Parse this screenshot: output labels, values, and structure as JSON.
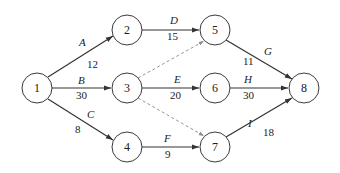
{
  "diagram": {
    "type": "activity-on-arrow network",
    "nodes": [
      {
        "id": "1",
        "label": "1",
        "x": 37,
        "y": 88
      },
      {
        "id": "2",
        "label": "2",
        "x": 127,
        "y": 30
      },
      {
        "id": "3",
        "label": "3",
        "x": 127,
        "y": 88
      },
      {
        "id": "4",
        "label": "4",
        "x": 127,
        "y": 147
      },
      {
        "id": "5",
        "label": "5",
        "x": 215,
        "y": 30
      },
      {
        "id": "6",
        "label": "6",
        "x": 215,
        "y": 88
      },
      {
        "id": "7",
        "label": "7",
        "x": 215,
        "y": 147
      },
      {
        "id": "8",
        "label": "8",
        "x": 304,
        "y": 88
      }
    ],
    "activities": [
      {
        "name": "A",
        "duration": "12",
        "from": "1",
        "to": "2"
      },
      {
        "name": "B",
        "duration": "30",
        "from": "1",
        "to": "3"
      },
      {
        "name": "C",
        "duration": "8",
        "from": "1",
        "to": "4"
      },
      {
        "name": "D",
        "duration": "15",
        "from": "2",
        "to": "5"
      },
      {
        "name": "E",
        "duration": "20",
        "from": "3",
        "to": "6"
      },
      {
        "name": "F",
        "duration": "9",
        "from": "4",
        "to": "7"
      },
      {
        "name": "G",
        "duration": "11",
        "from": "5",
        "to": "8"
      },
      {
        "name": "H",
        "duration": "30",
        "from": "6",
        "to": "8"
      },
      {
        "name": "I",
        "duration": "18",
        "from": "7",
        "to": "8"
      }
    ],
    "dummy_activities": [
      {
        "from": "3",
        "to": "5"
      },
      {
        "from": "3",
        "to": "7"
      }
    ]
  }
}
